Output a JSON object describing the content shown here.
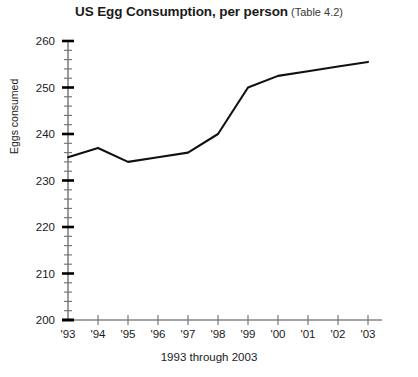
{
  "chart_data": {
    "type": "line",
    "title": "US Egg Consumption, per person",
    "title_note": "(Table 4.2)",
    "xlabel": "1993 through 2003",
    "ylabel": "Eggs consumed",
    "categories": [
      "'93",
      "'94",
      "'95",
      "'96",
      "'97",
      "'98",
      "'99",
      "'00",
      "'01",
      "'02",
      "'03"
    ],
    "years": [
      1993,
      1994,
      1995,
      1996,
      1997,
      1998,
      1999,
      2000,
      2001,
      2002,
      2003
    ],
    "values": [
      235,
      237,
      234,
      235,
      236,
      240,
      250,
      252.5,
      253.5,
      254.5,
      255.5
    ],
    "series": [
      {
        "name": "Eggs consumed",
        "values": [
          235,
          237,
          234,
          235,
          236,
          240,
          250,
          252.5,
          253.5,
          254.5,
          255.5
        ],
        "color": "#111111"
      }
    ],
    "ylim": [
      200,
      260
    ],
    "ytick_labels": [
      "200",
      "210",
      "220",
      "230",
      "240",
      "250",
      "260"
    ],
    "ytick_values": [
      200,
      210,
      220,
      230,
      240,
      250,
      260
    ],
    "ytick_minor_step": 2,
    "grid": false,
    "legend": false,
    "legend_position": "none",
    "line_color": "#111111",
    "axis_color": "#4a4a4a"
  }
}
